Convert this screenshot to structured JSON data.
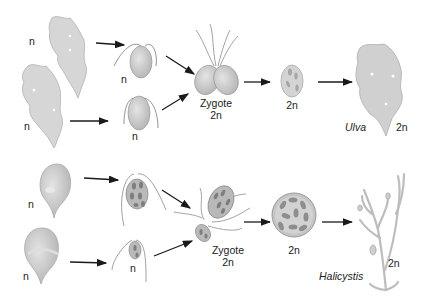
{
  "diagram": {
    "type": "life-cycle",
    "rows": [
      {
        "organism": "Ulva",
        "stages": [
          {
            "name": "gametophyte-1",
            "ploidy": "n"
          },
          {
            "name": "gametophyte-2",
            "ploidy": "n"
          },
          {
            "name": "gamete-1",
            "ploidy": "n"
          },
          {
            "name": "gamete-2",
            "ploidy": "n"
          },
          {
            "name": "zygote",
            "label": "Zygote",
            "ploidy": "2n"
          },
          {
            "name": "spore",
            "ploidy": "2n"
          },
          {
            "name": "adult",
            "label": "Ulva",
            "ploidy": "2n"
          }
        ]
      },
      {
        "organism": "Halicystis",
        "stages": [
          {
            "name": "gametophyte-1",
            "ploidy": "n"
          },
          {
            "name": "gametophyte-2",
            "ploidy": "n"
          },
          {
            "name": "gamete-large",
            "ploidy": ""
          },
          {
            "name": "gamete-small",
            "ploidy": "n"
          },
          {
            "name": "zygote",
            "label": "Zygote",
            "ploidy": "2n"
          },
          {
            "name": "spore",
            "ploidy": "2n"
          },
          {
            "name": "adult",
            "label": "Halicystis",
            "ploidy": "2n"
          }
        ]
      }
    ]
  },
  "labels": {
    "n": "n",
    "two_n": "2n",
    "zygote": "Zygote",
    "ulva": "Ulva",
    "halicystis": "Halicystis"
  },
  "colors": {
    "fill": "#c9c9c9",
    "fill_dark": "#9a9a9a",
    "stroke": "#8a8a8a",
    "arrow": "#1a1a1a",
    "text": "#222222"
  }
}
